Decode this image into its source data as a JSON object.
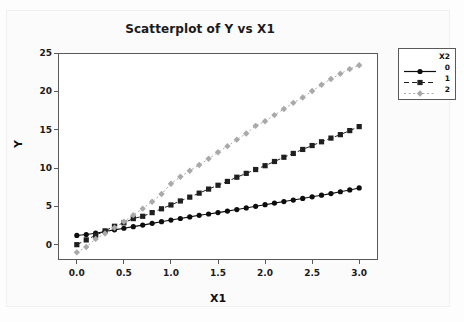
{
  "chart_data": {
    "type": "line",
    "title": "Scatterplot of Y vs X1",
    "xlabel": "X1",
    "ylabel": "Y",
    "xlim": [
      -0.2,
      3.2
    ],
    "ylim": [
      -2.0,
      25.0
    ],
    "xticks": [
      "0.0",
      "0.5",
      "1.0",
      "1.5",
      "2.0",
      "2.5",
      "3.0"
    ],
    "xtick_values": [
      0.0,
      0.5,
      1.0,
      1.5,
      2.0,
      2.5,
      3.0
    ],
    "yticks": [
      "0",
      "5",
      "10",
      "15",
      "20",
      "25"
    ],
    "ytick_values": [
      0,
      5,
      10,
      15,
      20,
      25
    ],
    "grid": false,
    "legend_position": "right-outside",
    "legend_title": "X2",
    "x": [
      0.0,
      0.1,
      0.2,
      0.3,
      0.4,
      0.5,
      0.6,
      0.7,
      0.8,
      0.9,
      1.0,
      1.1,
      1.2,
      1.3,
      1.4,
      1.5,
      1.6,
      1.7,
      1.8,
      1.9,
      2.0,
      2.1,
      2.2,
      2.3,
      2.4,
      2.5,
      2.6,
      2.7,
      2.8,
      2.9,
      3.0
    ],
    "series": [
      {
        "name": "0",
        "marker": "circle",
        "linestyle": "solid",
        "color": "#0d0d0d",
        "values": [
          1.2,
          1.32,
          1.5,
          1.71,
          1.93,
          2.14,
          2.35,
          2.55,
          2.78,
          3.0,
          3.21,
          3.41,
          3.62,
          3.83,
          4.0,
          4.18,
          4.38,
          4.58,
          4.79,
          5.0,
          5.21,
          5.42,
          5.62,
          5.82,
          6.03,
          6.24,
          6.45,
          6.66,
          6.9,
          7.14,
          7.4
        ]
      },
      {
        "name": "1",
        "marker": "square",
        "linestyle": "dashed",
        "color": "#1f1f1f",
        "values": [
          0.0,
          0.62,
          1.23,
          1.8,
          2.4,
          2.85,
          3.4,
          3.7,
          4.18,
          4.68,
          5.18,
          5.7,
          6.2,
          6.72,
          7.25,
          7.75,
          8.25,
          8.8,
          9.3,
          9.8,
          10.3,
          10.85,
          11.4,
          11.9,
          12.42,
          12.93,
          13.42,
          13.9,
          14.35,
          14.88,
          15.4
        ]
      },
      {
        "name": "2",
        "marker": "diamond",
        "linestyle": "dotted",
        "color": "#a9a9a9",
        "values": [
          -1.0,
          -0.3,
          0.75,
          1.45,
          2.2,
          3.0,
          3.85,
          4.7,
          5.6,
          6.6,
          7.95,
          8.85,
          9.65,
          10.4,
          11.2,
          12.05,
          12.85,
          13.7,
          14.5,
          15.5,
          16.1,
          16.9,
          17.7,
          18.5,
          19.2,
          20.05,
          20.85,
          21.6,
          22.3,
          22.9,
          23.4
        ]
      }
    ]
  },
  "legend": {
    "title": "X2",
    "entries": [
      {
        "label": "0"
      },
      {
        "label": "1"
      },
      {
        "label": "2"
      }
    ]
  }
}
